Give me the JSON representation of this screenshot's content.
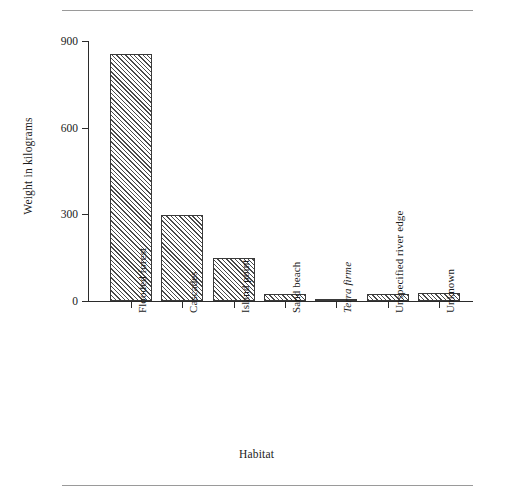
{
  "chart_data": {
    "type": "bar",
    "title": "",
    "subtitle": "",
    "xlabel": "Habitat",
    "ylabel": "Weight in kilograms",
    "categories": [
      "Flooded forest",
      "Cascades",
      "Island point",
      "Sand beach",
      "Terra firme",
      "Unspecified river edge",
      "Unknown"
    ],
    "category_styles": [
      "normal",
      "normal",
      "normal",
      "normal",
      "italic",
      "normal",
      "normal"
    ],
    "values": [
      855,
      297,
      148,
      25,
      5,
      25,
      28
    ],
    "ylim": [
      0,
      900
    ],
    "yticks": [
      0,
      300,
      600,
      900
    ],
    "ytick_labels": [
      "0",
      "300",
      "600",
      "900"
    ],
    "grid": false,
    "legend": false,
    "legend_position": "none",
    "bar_fill": "hatch-diagonal",
    "bar_edge_color": "#3a3a3a",
    "bar_hatch_color": "#4a4a4a",
    "axis_color": "#2b2b2b",
    "rule_color": "#9a9a9a",
    "background_color": "#ffffff"
  }
}
